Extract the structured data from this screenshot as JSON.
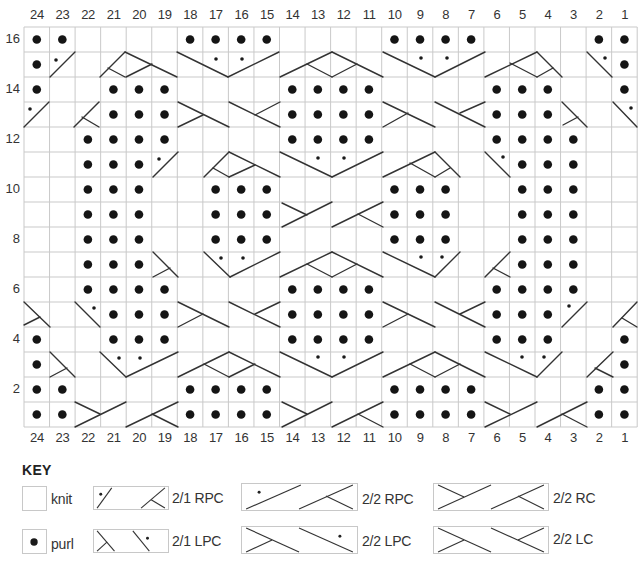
{
  "chart": {
    "columns": 24,
    "rows": 16,
    "column_labels_top": [
      "24",
      "23",
      "22",
      "21",
      "20",
      "19",
      "18",
      "17",
      "16",
      "15",
      "14",
      "13",
      "12",
      "11",
      "10",
      "9",
      "8",
      "7",
      "6",
      "5",
      "4",
      "3",
      "2",
      "1"
    ],
    "column_labels_bottom": [
      "24",
      "23",
      "22",
      "21",
      "20",
      "19",
      "18",
      "17",
      "16",
      "15",
      "14",
      "13",
      "12",
      "11",
      "10",
      "9",
      "8",
      "7",
      "6",
      "5",
      "4",
      "3",
      "2",
      "1"
    ],
    "row_labels": [
      {
        "row": 16,
        "label": "16"
      },
      {
        "row": 14,
        "label": "14"
      },
      {
        "row": 12,
        "label": "12"
      },
      {
        "row": 10,
        "label": "10"
      },
      {
        "row": 8,
        "label": "8"
      },
      {
        "row": 6,
        "label": "6"
      },
      {
        "row": 4,
        "label": "4"
      },
      {
        "row": 2,
        "label": "2"
      }
    ],
    "grid": {
      "left": 24,
      "top": 27,
      "cell_w": 25.55,
      "cell_h": 25,
      "line_color": "#c9c9c9",
      "ink_color": "#333333"
    },
    "purl_stitches": {
      "16": [
        24,
        23,
        18,
        17,
        16,
        15,
        10,
        9,
        8,
        7,
        2,
        1
      ],
      "15": [
        24,
        1
      ],
      "14": [
        24,
        21,
        20,
        19,
        14,
        13,
        12,
        11,
        6,
        5,
        4,
        1
      ],
      "13": [
        21,
        20,
        19,
        14,
        13,
        12,
        11,
        6,
        5,
        4
      ],
      "12": [
        22,
        21,
        20,
        19,
        14,
        13,
        12,
        11,
        6,
        5,
        4,
        3
      ],
      "11": [
        22,
        21,
        20,
        5,
        4,
        3
      ],
      "10": [
        22,
        21,
        20,
        17,
        16,
        15,
        10,
        9,
        8,
        5,
        4,
        3
      ],
      "9": [
        22,
        21,
        20,
        17,
        16,
        15,
        10,
        9,
        8,
        5,
        4,
        3
      ],
      "8": [
        22,
        21,
        20,
        17,
        16,
        15,
        10,
        9,
        8,
        5,
        4,
        3
      ],
      "7": [
        22,
        21,
        20,
        5,
        4,
        3
      ],
      "6": [
        22,
        21,
        20,
        19,
        14,
        13,
        12,
        11,
        6,
        5,
        4,
        3
      ],
      "5": [
        21,
        20,
        19,
        14,
        13,
        12,
        11,
        6,
        5,
        4
      ],
      "4": [
        24,
        21,
        20,
        19,
        14,
        13,
        12,
        11,
        6,
        5,
        4,
        1
      ],
      "3": [
        24,
        1
      ],
      "2": [
        24,
        23,
        18,
        17,
        16,
        15,
        10,
        9,
        8,
        7,
        2,
        1
      ],
      "1": [
        24,
        23,
        18,
        17,
        16,
        15,
        10,
        9,
        8,
        7,
        2,
        1
      ]
    },
    "cable_segments": [
      [
        50,
        77,
        75,
        52
      ],
      [
        100,
        77,
        125,
        52
      ],
      [
        125,
        52,
        177,
        77
      ],
      [
        108,
        68,
        125,
        77
      ],
      [
        126,
        77,
        152,
        64
      ],
      [
        177,
        52,
        228,
        77
      ],
      [
        228,
        77,
        279,
        52
      ],
      [
        280,
        77,
        332,
        52
      ],
      [
        307,
        64,
        332,
        77
      ],
      [
        332,
        52,
        383,
        77
      ],
      [
        332,
        77,
        357,
        64
      ],
      [
        383,
        52,
        435,
        77
      ],
      [
        435,
        77,
        485,
        52
      ],
      [
        485,
        77,
        537,
        52
      ],
      [
        510,
        63,
        537,
        77
      ],
      [
        537,
        52,
        562,
        77
      ],
      [
        537,
        77,
        553,
        68
      ],
      [
        587,
        52,
        612,
        77
      ],
      [
        24,
        127,
        49,
        102
      ],
      [
        74,
        127,
        99,
        102
      ],
      [
        82,
        117,
        99,
        127
      ],
      [
        178,
        102,
        229,
        127
      ],
      [
        178,
        127,
        203,
        115
      ],
      [
        229,
        102,
        280,
        127
      ],
      [
        255,
        115,
        280,
        102
      ],
      [
        383,
        102,
        435,
        127
      ],
      [
        383,
        127,
        408,
        113
      ],
      [
        435,
        102,
        485,
        127
      ],
      [
        460,
        113,
        485,
        102
      ],
      [
        562,
        102,
        587,
        127
      ],
      [
        563,
        125,
        578,
        117
      ],
      [
        613,
        102,
        637,
        127
      ],
      [
        153,
        177,
        178,
        152
      ],
      [
        204,
        177,
        229,
        152
      ],
      [
        213,
        168,
        229,
        177
      ],
      [
        229,
        152,
        280,
        177
      ],
      [
        229,
        177,
        255,
        165
      ],
      [
        280,
        152,
        332,
        177
      ],
      [
        332,
        177,
        383,
        152
      ],
      [
        383,
        177,
        435,
        152
      ],
      [
        410,
        163,
        435,
        177
      ],
      [
        435,
        152,
        460,
        177
      ],
      [
        435,
        177,
        450,
        168
      ],
      [
        485,
        152,
        510,
        177
      ],
      [
        282,
        203,
        307,
        215
      ],
      [
        282,
        227,
        332,
        202
      ],
      [
        332,
        227,
        383,
        202
      ],
      [
        358,
        214,
        383,
        227
      ],
      [
        153,
        252,
        178,
        277
      ],
      [
        153,
        277,
        170,
        268
      ],
      [
        204,
        252,
        230,
        277
      ],
      [
        230,
        277,
        280,
        252
      ],
      [
        280,
        277,
        332,
        252
      ],
      [
        307,
        264,
        332,
        277
      ],
      [
        332,
        252,
        383,
        277
      ],
      [
        332,
        277,
        357,
        264
      ],
      [
        383,
        252,
        435,
        277
      ],
      [
        435,
        277,
        460,
        252
      ],
      [
        485,
        277,
        510,
        252
      ],
      [
        493,
        268,
        510,
        277
      ],
      [
        24,
        302,
        50,
        327
      ],
      [
        24,
        325,
        40,
        317
      ],
      [
        75,
        302,
        100,
        327
      ],
      [
        178,
        302,
        229,
        327
      ],
      [
        178,
        327,
        203,
        314
      ],
      [
        229,
        302,
        280,
        327
      ],
      [
        255,
        314,
        280,
        302
      ],
      [
        383,
        302,
        435,
        327
      ],
      [
        383,
        327,
        408,
        314
      ],
      [
        435,
        302,
        485,
        327
      ],
      [
        460,
        314,
        485,
        302
      ],
      [
        562,
        327,
        587,
        302
      ],
      [
        613,
        327,
        637,
        302
      ],
      [
        622,
        318,
        637,
        327
      ],
      [
        50,
        352,
        75,
        377
      ],
      [
        50,
        377,
        67,
        368
      ],
      [
        100,
        352,
        126,
        377
      ],
      [
        126,
        377,
        178,
        352
      ],
      [
        178,
        377,
        229,
        352
      ],
      [
        204,
        364,
        229,
        377
      ],
      [
        229,
        352,
        280,
        377
      ],
      [
        229,
        377,
        255,
        364
      ],
      [
        280,
        352,
        332,
        377
      ],
      [
        332,
        377,
        383,
        352
      ],
      [
        383,
        377,
        435,
        352
      ],
      [
        410,
        364,
        435,
        377
      ],
      [
        435,
        352,
        485,
        377
      ],
      [
        435,
        377,
        460,
        364
      ],
      [
        485,
        352,
        537,
        377
      ],
      [
        537,
        377,
        562,
        352
      ],
      [
        587,
        377,
        613,
        352
      ],
      [
        595,
        368,
        613,
        377
      ],
      [
        75,
        402,
        100,
        414
      ],
      [
        75,
        427,
        126,
        402
      ],
      [
        126,
        427,
        178,
        402
      ],
      [
        152,
        414,
        178,
        427
      ],
      [
        282,
        402,
        307,
        414
      ],
      [
        282,
        427,
        332,
        402
      ],
      [
        332,
        427,
        383,
        402
      ],
      [
        358,
        414,
        383,
        427
      ],
      [
        485,
        402,
        510,
        414
      ],
      [
        485,
        427,
        537,
        402
      ],
      [
        537,
        427,
        587,
        402
      ],
      [
        562,
        414,
        587,
        427
      ]
    ],
    "cable_dots": [
      [
        56,
        60
      ],
      [
        216,
        59
      ],
      [
        242,
        59
      ],
      [
        421,
        58
      ],
      [
        447,
        58
      ],
      [
        605,
        58
      ],
      [
        30,
        109
      ],
      [
        631,
        108
      ],
      [
        159,
        159
      ],
      [
        318,
        158
      ],
      [
        344,
        158
      ],
      [
        503,
        157
      ],
      [
        221,
        258
      ],
      [
        243,
        258
      ],
      [
        421,
        257
      ],
      [
        442,
        257
      ],
      [
        94,
        308
      ],
      [
        569,
        306
      ],
      [
        119,
        358
      ],
      [
        140,
        358
      ],
      [
        318,
        357
      ],
      [
        344,
        357
      ],
      [
        522,
        357
      ],
      [
        544,
        357
      ]
    ]
  },
  "key": {
    "title": "KEY",
    "items": [
      {
        "id": "knit",
        "label": "knit",
        "symbol": "empty-square"
      },
      {
        "id": "purl",
        "label": "purl",
        "symbol": "dot"
      },
      {
        "id": "rpc21",
        "label": "2/1 RPC",
        "symbol": "2-1-right-purl-cross"
      },
      {
        "id": "lpc21",
        "label": "2/1 LPC",
        "symbol": "2-1-left-purl-cross"
      },
      {
        "id": "rpc22",
        "label": "2/2 RPC",
        "symbol": "2-2-right-purl-cross"
      },
      {
        "id": "lpc22",
        "label": "2/2 LPC",
        "symbol": "2-2-left-purl-cross"
      },
      {
        "id": "rc22",
        "label": "2/2 RC",
        "symbol": "2-2-right-cross"
      },
      {
        "id": "lc22",
        "label": "2/2 LC",
        "symbol": "2-2-left-cross"
      }
    ]
  }
}
